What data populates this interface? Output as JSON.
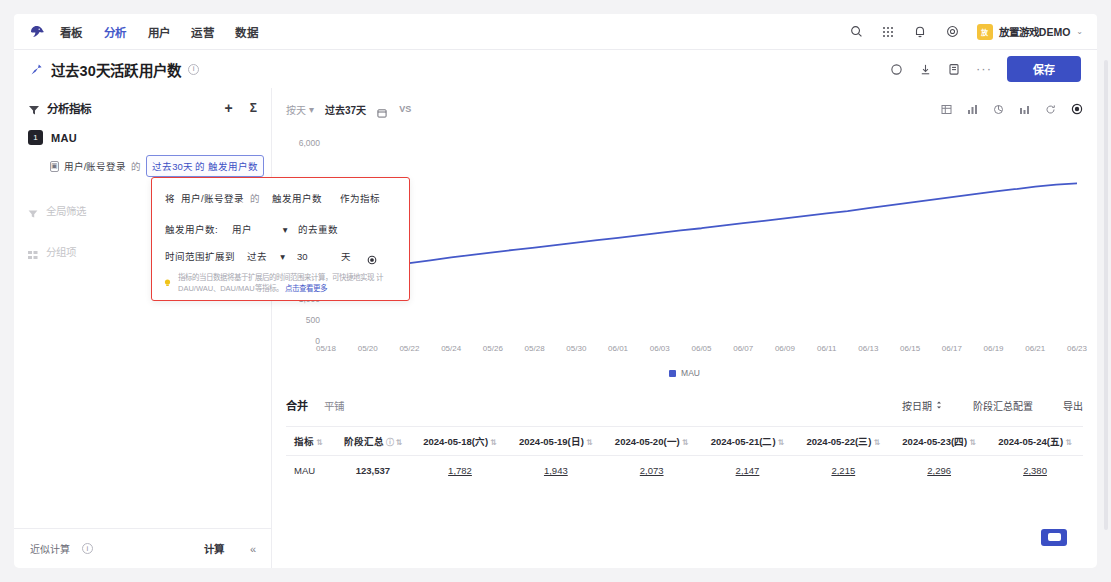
{
  "topnav": {
    "logo_icon": "bird-logo-icon",
    "items": [
      {
        "label": "看板",
        "active": false
      },
      {
        "label": "分析",
        "active": true
      },
      {
        "label": "用户",
        "active": false
      },
      {
        "label": "运营",
        "active": false
      },
      {
        "label": "数据",
        "active": false
      }
    ],
    "icons": [
      "search-icon",
      "grid-apps-icon",
      "bell-icon",
      "settings-gear-icon"
    ],
    "user": {
      "avatar_initials": "放",
      "name": "放置游戏DEMO",
      "caret": "⌄",
      "avatar_color": "#f5c33b"
    }
  },
  "title_row": {
    "pin_icon": "pin-icon",
    "title": "过去30天活跃用户数",
    "info_icon": "info-circle-icon",
    "actions": [
      "history-icon",
      "download-icon",
      "copy-icon"
    ],
    "more": "···",
    "save_label": "保存",
    "save_color": "#3b4fc4"
  },
  "left_panel": {
    "header_icon": "funnel-metric-icon",
    "header_title": "分析指标",
    "add_label": "+",
    "sigma_label": "Σ",
    "metric": {
      "badge": "1",
      "name": "MAU",
      "event_icon": "event-icon",
      "event_label": "用户/账号登录",
      "de_1": "的",
      "chip_label": "过去30天 的 触发用户数"
    },
    "items": [
      {
        "icon": "filter-icon",
        "label": "全局筛选"
      },
      {
        "icon": "group-icon",
        "label": "分组项"
      }
    ],
    "bottom": {
      "approx_label": "近似计算",
      "approx_info_icon": "info-circle-icon",
      "calc_label": "计算",
      "collapse_icon": "«"
    }
  },
  "popup": {
    "row1": {
      "prefix": "将",
      "event": "用户/账号登录",
      "de": "的",
      "metric": "触发用户数",
      "suffix": "作为指标"
    },
    "row2": {
      "label": "触发用户数:",
      "select": "用户",
      "caret": "▾",
      "suffix": "的去重数"
    },
    "row3": {
      "label": "时间范围扩展到",
      "select": "过去",
      "caret": "▾",
      "value": "30",
      "unit": "天",
      "gear_icon": "settings-gear-icon"
    },
    "tip": {
      "bulb_icon": "lightbulb-icon",
      "line1": "指标的当日数据将基于扩展后的时间范围来计算，可快捷地实现",
      "line2": "计DAU/WAU、DAU/MAU等指标。",
      "link": "点击查看更多"
    },
    "border_color": "#e8403a"
  },
  "chart_toolbar": {
    "granularity": "按天",
    "granularity_caret": "▾",
    "range": "过去37天",
    "calendar_icon": "calendar-icon",
    "vs_label": "VS",
    "right_icons": [
      "table-chart-icon",
      "bar-chart-icon",
      "pie-chart-icon",
      "column-chart-icon",
      "refresh-icon",
      "settings-gear-icon"
    ]
  },
  "chart_data": {
    "type": "line",
    "title": "",
    "xlabel": "",
    "ylabel": "",
    "ylim": [
      0,
      6000
    ],
    "ytick_labels": [
      "6,000",
      "1,000",
      "500",
      "0"
    ],
    "grid": false,
    "legend": [
      {
        "name": "MAU",
        "color": "#4559c9"
      }
    ],
    "legend_position": "bottom",
    "x": [
      "05/18",
      "05/19",
      "05/20",
      "05/21",
      "05/22",
      "05/23",
      "05/24",
      "05/25",
      "05/26",
      "05/27",
      "05/28",
      "05/29",
      "05/30",
      "05/31",
      "06/01",
      "06/02",
      "06/03",
      "06/04",
      "06/05",
      "06/06",
      "06/07",
      "06/08",
      "06/09",
      "06/10",
      "06/11",
      "06/12",
      "06/13",
      "06/14",
      "06/15",
      "06/16",
      "06/17",
      "06/18",
      "06/19",
      "06/20",
      "06/21",
      "06/22",
      "06/23"
    ],
    "xtick_labels": [
      "05/18",
      "05/20",
      "05/22",
      "05/24",
      "05/26",
      "05/28",
      "05/30",
      "06/01",
      "06/03",
      "06/05",
      "06/07",
      "06/09",
      "06/11",
      "06/13",
      "06/15",
      "06/17",
      "06/19",
      "06/21",
      "06/23"
    ],
    "series": [
      {
        "name": "MAU",
        "color": "#4559c9",
        "values": [
          1782,
          1943,
          2073,
          2147,
          2215,
          2296,
          2380,
          2455,
          2530,
          2600,
          2665,
          2740,
          2810,
          2880,
          2950,
          3020,
          3090,
          3160,
          3225,
          3300,
          3370,
          3440,
          3510,
          3580,
          3650,
          3720,
          3800,
          3880,
          3960,
          4040,
          4120,
          4200,
          4280,
          4350,
          4420,
          4480,
          4520
        ]
      }
    ]
  },
  "table_header": {
    "tabs": [
      {
        "label": "合并",
        "active": true
      },
      {
        "label": "平铺",
        "active": false
      }
    ],
    "actions": [
      {
        "label": "按日期",
        "icon": "sort-icon"
      },
      {
        "label": "阶段汇总配置",
        "icon": ""
      },
      {
        "label": "导出",
        "icon": ""
      }
    ]
  },
  "table": {
    "columns": [
      {
        "label": "指标",
        "sort": "⇅"
      },
      {
        "label": "阶段汇总",
        "info": "ⓘ",
        "sort": "⇅"
      },
      {
        "label": "2024-05-18(六)",
        "sort": "⇅"
      },
      {
        "label": "2024-05-19(日)",
        "sort": "⇅"
      },
      {
        "label": "2024-05-20(一)",
        "sort": "⇅"
      },
      {
        "label": "2024-05-21(二)",
        "sort": "⇅"
      },
      {
        "label": "2024-05-22(三)",
        "sort": "⇅"
      },
      {
        "label": "2024-05-23(四)",
        "sort": "⇅"
      },
      {
        "label": "2024-05-24(五)",
        "sort": "⇅"
      }
    ],
    "rows": [
      {
        "metric": "MAU",
        "total": "123,537",
        "values": [
          "1,782",
          "1,943",
          "2,073",
          "2,147",
          "2,215",
          "2,296",
          "2,380"
        ]
      }
    ]
  },
  "fab": {
    "icon": "chat-support-icon",
    "color": "#3b4fc4"
  }
}
